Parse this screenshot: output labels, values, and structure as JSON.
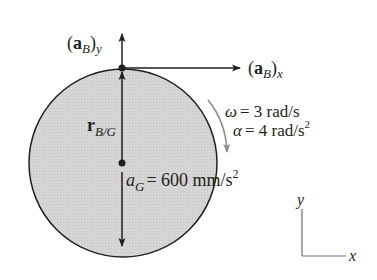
{
  "diagram": {
    "vectors": {
      "aBy": {
        "main": "a",
        "sub": "B",
        "comp": "y"
      },
      "aBx": {
        "main": "a",
        "sub": "B",
        "comp": "x"
      },
      "rBG": {
        "main": "r",
        "sub": "B/G"
      }
    },
    "rotation": {
      "omega_symbol": "ω",
      "omega_value": "= 3 rad/s",
      "alpha_symbol": "α",
      "alpha_value": "= 4 rad/s",
      "alpha_exp": "2"
    },
    "center_accel": {
      "symbol": "a",
      "sub": "G",
      "value": "= 600 mm/s",
      "exp": "2"
    },
    "axes": {
      "x": "x",
      "y": "y"
    },
    "colors": {
      "disk_fill": "#d2d2d2",
      "outline": "#231f20",
      "rotation_arrow": "#8c8c8c"
    }
  }
}
